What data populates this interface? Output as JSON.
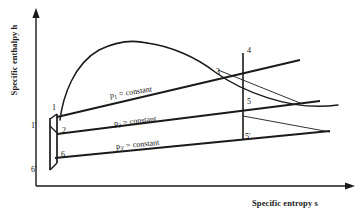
{
  "figure": {
    "type": "h-s (Mollier) diagram",
    "axes": {
      "y_label": "Specific enthalpy h",
      "x_label": "Specific entropy s"
    },
    "isobars": [
      {
        "id": "p1",
        "symbol": "p",
        "subscript": "1",
        "equals": "=",
        "value": "constant"
      },
      {
        "id": "p3",
        "symbol": "p",
        "subscript": "3",
        "equals": "=",
        "value": "constant"
      },
      {
        "id": "p3p",
        "symbol": "p",
        "subscript": "3'",
        "equals": "=",
        "value": "constant"
      }
    ],
    "state_points": [
      {
        "id": "1p",
        "label": "1'"
      },
      {
        "id": "1",
        "label": "1"
      },
      {
        "id": "2",
        "label": "2"
      },
      {
        "id": "6",
        "label": "6"
      },
      {
        "id": "6p",
        "label": "6'"
      },
      {
        "id": "3",
        "label": "3"
      },
      {
        "id": "4",
        "label": "4"
      },
      {
        "id": "5",
        "label": "5"
      },
      {
        "id": "5p",
        "label": "5'"
      }
    ],
    "colors": {
      "ink": "#1a1a1a",
      "background": "#ffffff"
    }
  }
}
